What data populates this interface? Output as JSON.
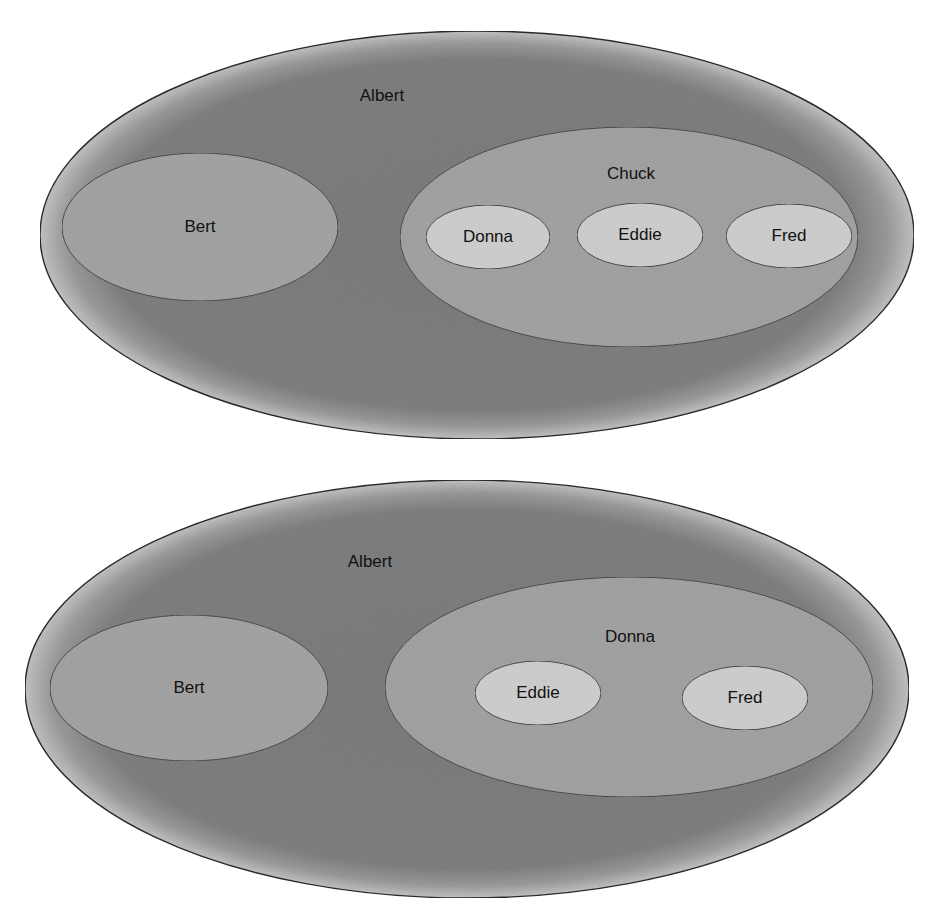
{
  "colors": {
    "background": "#ffffff",
    "outer_fill": "#7e7e7e",
    "outer_rim": "#b4b4b4",
    "mid_fill": "#a3a3a3",
    "inner_fill": "#cfcfcf",
    "stroke": "#2a2a2a",
    "text": "#111111"
  },
  "diagrams": [
    {
      "outer": {
        "label": "Albert"
      },
      "left": {
        "label": "Bert"
      },
      "right": {
        "label": "Chuck",
        "children": [
          {
            "label": "Donna"
          },
          {
            "label": "Eddie"
          },
          {
            "label": "Fred"
          }
        ]
      }
    },
    {
      "outer": {
        "label": "Albert"
      },
      "left": {
        "label": "Bert"
      },
      "right": {
        "label": "Donna",
        "children": [
          {
            "label": "Eddie"
          },
          {
            "label": "Fred"
          }
        ]
      }
    }
  ]
}
